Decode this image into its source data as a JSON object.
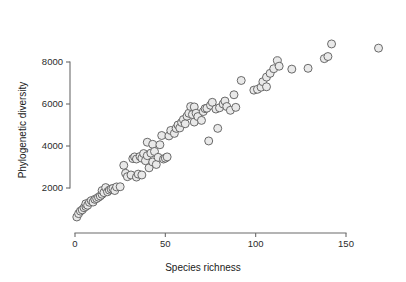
{
  "chart_data": {
    "type": "scatter",
    "title": "",
    "xlabel": "Species richness",
    "ylabel": "Phylogenetic diversity",
    "xlim": [
      0,
      170
    ],
    "ylim": [
      400,
      9200
    ],
    "xticks": [
      0,
      50,
      100,
      150
    ],
    "yticks": [
      2000,
      4000,
      6000,
      8000
    ],
    "xtick_labels": [
      "0",
      "50",
      "100",
      "150"
    ],
    "ytick_labels": [
      "2000",
      "4000",
      "6000",
      "8000"
    ],
    "grid": false,
    "legend": "none",
    "marker": {
      "shape": "circle",
      "fill_color": "#e9e9e9",
      "edge_color": "#5a5a5a",
      "size_px": 8
    },
    "axis_color": "#6b6b6b",
    "background_color": "#ffffff",
    "points": [
      {
        "x": 1,
        "y": 620
      },
      {
        "x": 2,
        "y": 780
      },
      {
        "x": 3,
        "y": 900
      },
      {
        "x": 4,
        "y": 960
      },
      {
        "x": 5,
        "y": 1060
      },
      {
        "x": 6,
        "y": 1120
      },
      {
        "x": 6,
        "y": 1250
      },
      {
        "x": 7,
        "y": 1180
      },
      {
        "x": 8,
        "y": 1320
      },
      {
        "x": 9,
        "y": 1400
      },
      {
        "x": 10,
        "y": 1330
      },
      {
        "x": 11,
        "y": 1460
      },
      {
        "x": 12,
        "y": 1500
      },
      {
        "x": 13,
        "y": 1560
      },
      {
        "x": 14,
        "y": 1620
      },
      {
        "x": 15,
        "y": 1700
      },
      {
        "x": 15,
        "y": 1880
      },
      {
        "x": 16,
        "y": 1780
      },
      {
        "x": 17,
        "y": 2020
      },
      {
        "x": 18,
        "y": 1820
      },
      {
        "x": 19,
        "y": 1900
      },
      {
        "x": 20,
        "y": 1950
      },
      {
        "x": 21,
        "y": 1980
      },
      {
        "x": 22,
        "y": 1880
      },
      {
        "x": 23,
        "y": 2050
      },
      {
        "x": 25,
        "y": 2060
      },
      {
        "x": 27,
        "y": 3080
      },
      {
        "x": 28,
        "y": 2700
      },
      {
        "x": 29,
        "y": 2540
      },
      {
        "x": 31,
        "y": 2620
      },
      {
        "x": 32,
        "y": 3400
      },
      {
        "x": 33,
        "y": 3480
      },
      {
        "x": 34,
        "y": 2520
      },
      {
        "x": 34,
        "y": 3380
      },
      {
        "x": 35,
        "y": 2660
      },
      {
        "x": 36,
        "y": 3500
      },
      {
        "x": 37,
        "y": 3420
      },
      {
        "x": 37,
        "y": 2620
      },
      {
        "x": 38,
        "y": 3640
      },
      {
        "x": 39,
        "y": 3300
      },
      {
        "x": 40,
        "y": 4180
      },
      {
        "x": 40,
        "y": 3540
      },
      {
        "x": 41,
        "y": 2960
      },
      {
        "x": 42,
        "y": 3660
      },
      {
        "x": 43,
        "y": 4080
      },
      {
        "x": 43,
        "y": 3240
      },
      {
        "x": 44,
        "y": 3740
      },
      {
        "x": 45,
        "y": 3120
      },
      {
        "x": 46,
        "y": 3460
      },
      {
        "x": 47,
        "y": 4060
      },
      {
        "x": 48,
        "y": 4500
      },
      {
        "x": 49,
        "y": 3380
      },
      {
        "x": 50,
        "y": 3420
      },
      {
        "x": 51,
        "y": 3480
      },
      {
        "x": 52,
        "y": 4480
      },
      {
        "x": 53,
        "y": 4740
      },
      {
        "x": 55,
        "y": 4600
      },
      {
        "x": 56,
        "y": 4840
      },
      {
        "x": 57,
        "y": 5000
      },
      {
        "x": 58,
        "y": 4860
      },
      {
        "x": 59,
        "y": 5120
      },
      {
        "x": 60,
        "y": 5260
      },
      {
        "x": 61,
        "y": 5060
      },
      {
        "x": 62,
        "y": 5420
      },
      {
        "x": 63,
        "y": 5560
      },
      {
        "x": 64,
        "y": 5880
      },
      {
        "x": 65,
        "y": 5500
      },
      {
        "x": 66,
        "y": 5860
      },
      {
        "x": 66,
        "y": 5140
      },
      {
        "x": 67,
        "y": 5560
      },
      {
        "x": 68,
        "y": 5400
      },
      {
        "x": 70,
        "y": 5220
      },
      {
        "x": 71,
        "y": 5640
      },
      {
        "x": 72,
        "y": 5780
      },
      {
        "x": 73,
        "y": 5800
      },
      {
        "x": 74,
        "y": 4240
      },
      {
        "x": 75,
        "y": 5940
      },
      {
        "x": 76,
        "y": 6080
      },
      {
        "x": 78,
        "y": 5760
      },
      {
        "x": 79,
        "y": 4840
      },
      {
        "x": 80,
        "y": 5820
      },
      {
        "x": 82,
        "y": 6000
      },
      {
        "x": 83,
        "y": 6140
      },
      {
        "x": 84,
        "y": 5880
      },
      {
        "x": 86,
        "y": 5700
      },
      {
        "x": 88,
        "y": 6440
      },
      {
        "x": 89,
        "y": 5840
      },
      {
        "x": 92,
        "y": 7120
      },
      {
        "x": 99,
        "y": 6660
      },
      {
        "x": 101,
        "y": 6700
      },
      {
        "x": 103,
        "y": 6800
      },
      {
        "x": 104,
        "y": 7060
      },
      {
        "x": 106,
        "y": 7280
      },
      {
        "x": 106,
        "y": 6820
      },
      {
        "x": 108,
        "y": 7460
      },
      {
        "x": 110,
        "y": 7680
      },
      {
        "x": 112,
        "y": 8060
      },
      {
        "x": 113,
        "y": 7800
      },
      {
        "x": 120,
        "y": 7660
      },
      {
        "x": 129,
        "y": 7700
      },
      {
        "x": 138,
        "y": 8160
      },
      {
        "x": 140,
        "y": 8260
      },
      {
        "x": 142,
        "y": 8860
      },
      {
        "x": 168,
        "y": 8660
      }
    ]
  }
}
